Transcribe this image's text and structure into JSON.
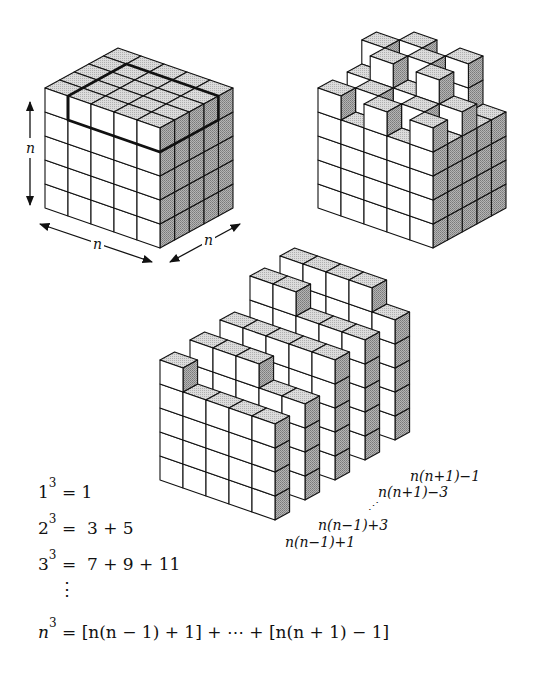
{
  "figure": {
    "n": 5,
    "colors": {
      "line": "#111111",
      "top_face": "#d4d4d4",
      "side_face": "#a8a8a8",
      "front_face": "#ffffff"
    }
  },
  "cube_labels": {
    "height": "n",
    "width": "n",
    "depth": "n"
  },
  "slab_labels": [
    "n(n−1)+1",
    "n(n−1)+3",
    "⋰",
    "n(n+1)−3",
    "n(n+1)−1"
  ],
  "slab_heights": [
    [
      5,
      4,
      4,
      4,
      4
    ],
    [
      5,
      5,
      5,
      4,
      4
    ],
    [
      5,
      5,
      5,
      5,
      5
    ],
    [
      6,
      6,
      5,
      5,
      5
    ],
    [
      6,
      6,
      6,
      6,
      5
    ]
  ],
  "equations": [
    {
      "base": "1",
      "exp": "3",
      "rhs": "= 1"
    },
    {
      "base": "2",
      "exp": "3",
      "rhs": "=  3 + 5"
    },
    {
      "base": "3",
      "exp": "3",
      "rhs": "=  7 + 9 + 11"
    },
    {
      "base": "n",
      "exp": "3",
      "rhs": "= [n(n − 1) + 1] + ⋯ + [n(n + 1) − 1]"
    }
  ],
  "vertical_dots": "⋮"
}
